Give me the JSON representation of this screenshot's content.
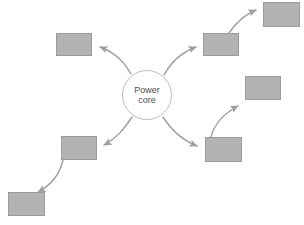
{
  "diagram": {
    "type": "radial-hub-and-spoke",
    "background_color": "#ffffff",
    "core": {
      "label_line1": "Power",
      "label_line2": "core",
      "shape": "circle",
      "fill_color": "#ffffff",
      "border_color": "#bdbdbd",
      "text_color": "#4d4d4d",
      "cx": 147,
      "cy": 95,
      "r": 25
    },
    "node_style": {
      "fill_color": "#b3b3b3",
      "border_color": "#9a9a9a"
    },
    "arrow_style": {
      "line_color": "#9e9e9e",
      "head_color": "#9e9e9e",
      "width": 1.4
    },
    "nodes": [
      {
        "id": "node-upper-left",
        "x": 56,
        "y": 33,
        "w": 36,
        "h": 23
      },
      {
        "id": "node-upper-right",
        "x": 203,
        "y": 33,
        "w": 36,
        "h": 23
      },
      {
        "id": "node-top-right",
        "x": 263,
        "y": 2,
        "w": 37,
        "h": 25
      },
      {
        "id": "node-mid-right",
        "x": 245,
        "y": 76,
        "w": 36,
        "h": 24
      },
      {
        "id": "node-mid-left",
        "x": 61,
        "y": 136,
        "w": 36,
        "h": 24
      },
      {
        "id": "node-lower-right",
        "x": 205,
        "y": 137,
        "w": 37,
        "h": 25
      },
      {
        "id": "node-bottom-left",
        "x": 8,
        "y": 192,
        "w": 37,
        "h": 24
      }
    ],
    "arrows": [
      {
        "id": "arrow-core-to-upper-left",
        "from": "core",
        "to": "node-upper-left",
        "path": "M 131,74 C 124,62 116,53 100,47"
      },
      {
        "id": "arrow-core-to-upper-right",
        "from": "core",
        "to": "node-upper-right",
        "path": "M 164,75 C 171,62 180,53 196,47"
      },
      {
        "id": "arrow-core-to-mid-left",
        "from": "core",
        "to": "node-mid-left",
        "path": "M 132,117 C 124,129 117,138 104,145"
      },
      {
        "id": "arrow-core-to-lower-right",
        "from": "core",
        "to": "node-lower-right",
        "path": "M 163,117 C 171,129 180,139 197,146"
      },
      {
        "id": "arrow-upper-right-to-top-right",
        "from": "node-upper-right",
        "to": "node-top-right",
        "path": "M 229,33 C 235,24 244,15 256,10"
      },
      {
        "id": "arrow-lower-right-to-mid-right",
        "from": "node-lower-right",
        "to": "node-mid-right",
        "path": "M 211,137 C 214,125 223,114 238,106"
      },
      {
        "id": "arrow-mid-left-to-bottom-left",
        "from": "node-mid-left",
        "to": "node-bottom-left",
        "path": "M 63,160 C 60,174 51,185 38,192"
      }
    ]
  }
}
